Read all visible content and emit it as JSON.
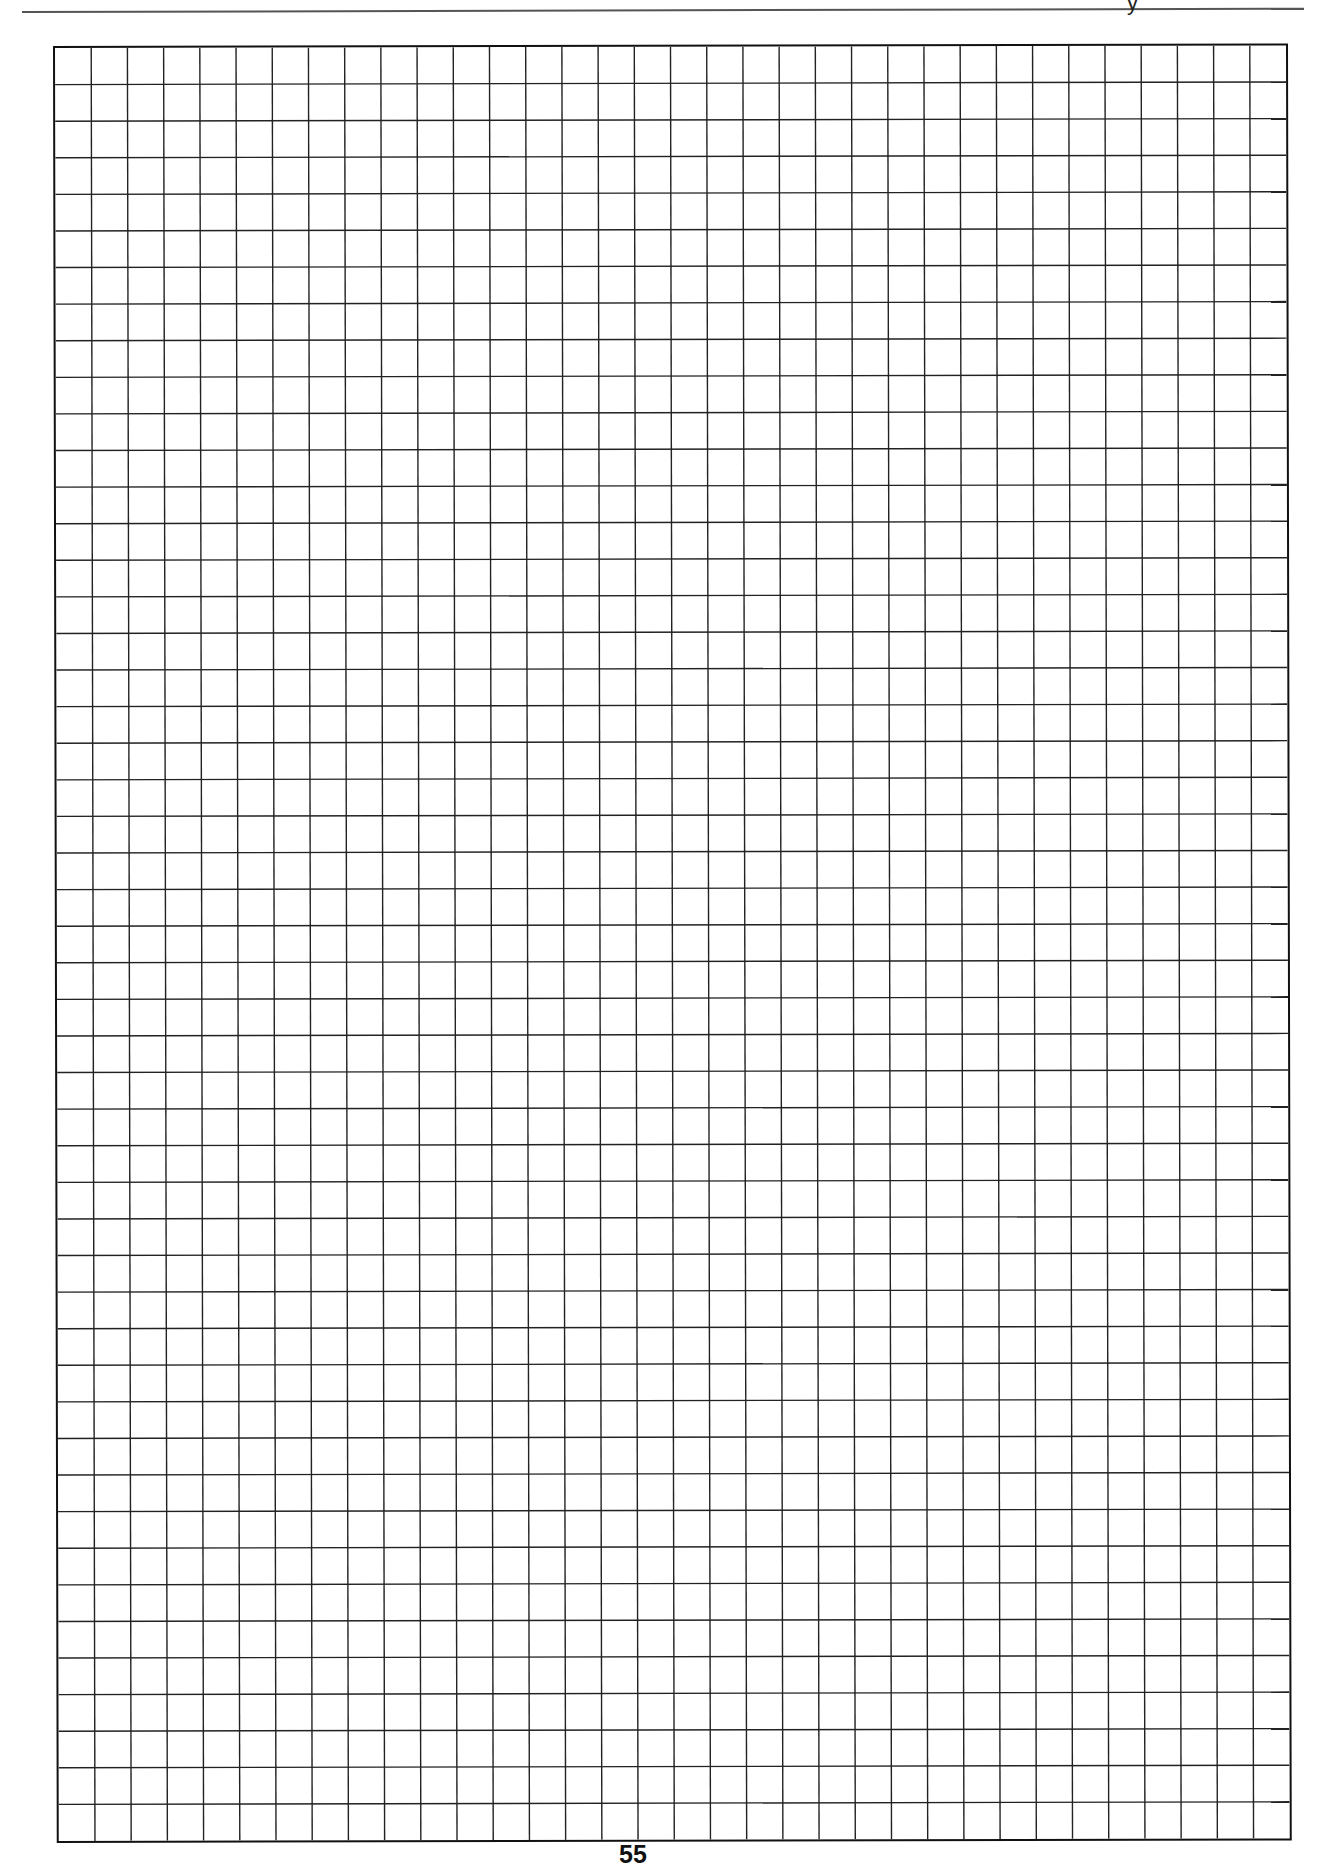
{
  "header": {
    "fragment": "y"
  },
  "grid": {
    "columns": 34,
    "rows": 49,
    "line_color": "#222222",
    "border_color": "#111111"
  },
  "footer": {
    "page_number": "55"
  }
}
